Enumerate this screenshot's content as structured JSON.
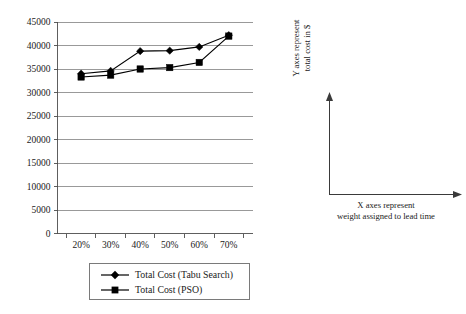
{
  "chart_data": {
    "type": "line",
    "title": "",
    "xlabel": "",
    "ylabel": "",
    "categories": [
      "20%",
      "30%",
      "40%",
      "50%",
      "60%",
      "70%"
    ],
    "series": [
      {
        "name": "Total Cost (Tabu Search)",
        "marker": "diamond",
        "values": [
          34000,
          34600,
          38800,
          38900,
          39700,
          42200
        ]
      },
      {
        "name": "Total Cost (PSO)",
        "marker": "square",
        "values": [
          33300,
          33700,
          35000,
          35300,
          36400,
          42000
        ]
      }
    ],
    "ylim": [
      0,
      45000
    ],
    "ytick_step": 5000,
    "yticks": [
      "0",
      "5000",
      "10000",
      "15000",
      "20000",
      "25000",
      "30000",
      "35000",
      "40000",
      "45000"
    ],
    "grid": true,
    "legend_position": "bottom"
  },
  "legend": {
    "entries": [
      {
        "label": "Total Cost (Tabu Search)",
        "marker": "diamond"
      },
      {
        "label": "Total Cost (PSO)",
        "marker": "square"
      }
    ]
  },
  "annotation": {
    "y_axis_line1": "Y axes represent",
    "y_axis_line2": "total cost in $",
    "x_axis_line1": "X axes represent",
    "x_axis_line2": "weight assigned to lead time"
  },
  "colors": {
    "series": "#000000",
    "grid": "#808080",
    "axis": "#4d4d4d",
    "text": "#1a1a1a",
    "background": "#ffffff",
    "legend_border": "#7a7a7a"
  }
}
